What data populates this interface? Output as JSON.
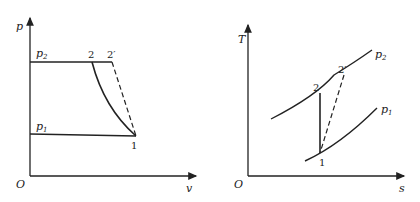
{
  "pv_diagram": {
    "y_axis_label": "p",
    "x_axis_label": "v",
    "origin_label": "O",
    "isobar_high_label": "p",
    "isobar_high_sub": "2",
    "isobar_low_label": "p",
    "isobar_low_sub": "1",
    "point_1": "1",
    "point_2": "2",
    "point_2prime": "2′"
  },
  "ts_diagram": {
    "y_axis_label": "T",
    "x_axis_label": "s",
    "origin_label": "O",
    "isobar_high_label": "p",
    "isobar_high_sub": "2",
    "isobar_low_label": "p",
    "isobar_low_sub": "1",
    "point_1": "1",
    "point_2": "2",
    "point_2prime": "2′"
  }
}
